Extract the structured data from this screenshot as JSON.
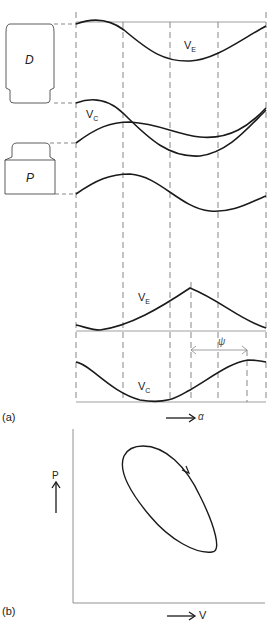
{
  "figure": {
    "panel_a": {
      "label": "(a)",
      "displacer_label": "D",
      "piston_label": "P",
      "curve_labels": {
        "expansion_volume_top": "V",
        "expansion_volume_top_sub": "E",
        "compression_volume_top": "V",
        "compression_volume_top_sub": "C",
        "expansion_volume_bottom": "V",
        "expansion_volume_bottom_sub": "E",
        "compression_volume_bottom": "V",
        "compression_volume_bottom_sub": "C"
      },
      "phase_angle_label": "ψ",
      "x_axis_label": "α"
    },
    "panel_b": {
      "label": "(b)",
      "y_axis_label": "P",
      "x_axis_label": "V"
    },
    "colors": {
      "line": "#222222",
      "dashed": "#555555",
      "background": "#ffffff"
    }
  }
}
